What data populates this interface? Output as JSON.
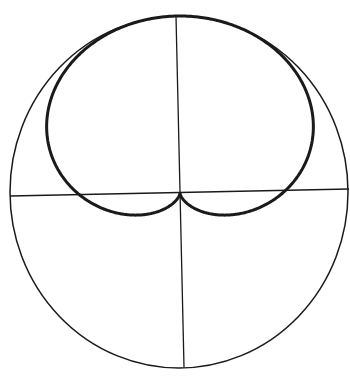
{
  "diagram": {
    "type": "polar-curve",
    "colors": {
      "background": "#ffffff",
      "line": "#1a1a1a"
    },
    "circle": {
      "cx": 179,
      "cy": 192,
      "rx": 169,
      "ry": 176,
      "stroke_width": 1.5
    },
    "axes": {
      "horizontal": {
        "x1": 10,
        "y1": 196,
        "x2": 349,
        "y2": 189,
        "stroke_width": 1.3
      },
      "vertical": {
        "x1": 176,
        "y1": 16,
        "x2": 184,
        "y2": 367,
        "stroke_width": 1.3
      }
    },
    "cardioid": {
      "cusp_x": 180,
      "cusp_y": 193,
      "a": 88.5,
      "x_scale": 1.16,
      "orientation": "up",
      "stroke_width": 3
    }
  }
}
